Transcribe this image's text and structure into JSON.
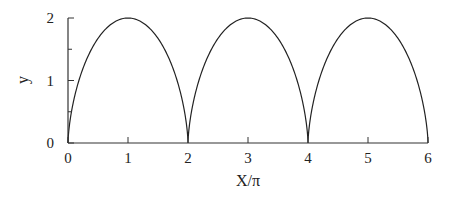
{
  "chart_data": {
    "type": "line",
    "title": "",
    "xlabel": "X/π",
    "ylabel": "y",
    "xlim": [
      0,
      6
    ],
    "ylim": [
      0,
      2
    ],
    "xticks": [
      0,
      1,
      2,
      3,
      4,
      5,
      6
    ],
    "xtick_labels": [
      "0",
      "1",
      "2",
      "3",
      "4",
      "5",
      "6"
    ],
    "yticks": [
      0,
      1,
      2
    ],
    "ytick_labels": [
      "0",
      "1",
      "2"
    ],
    "yminor_ticks": [
      0.5,
      1.5
    ],
    "grid": false,
    "legend": null,
    "series": [
      {
        "name": "cycloid",
        "description": "Cycloid y = 1 - cos(t), X = t - sin(t), plotted as X/π; arches of height 2 with cusps at X/π = 0, 2, 4, 6",
        "x": [
          0,
          0.5,
          1,
          1.5,
          2,
          2.5,
          3,
          3.5,
          4,
          4.5,
          5,
          5.5,
          6
        ],
        "y": [
          0,
          1.7,
          2,
          1.7,
          0,
          1.7,
          2,
          1.7,
          0,
          1.7,
          2,
          1.7,
          0
        ],
        "peaks": [
          {
            "x": 1,
            "y": 2
          },
          {
            "x": 3,
            "y": 2
          },
          {
            "x": 5,
            "y": 2
          }
        ],
        "cusps": [
          {
            "x": 0,
            "y": 0
          },
          {
            "x": 2,
            "y": 0
          },
          {
            "x": 4,
            "y": 0
          },
          {
            "x": 6,
            "y": 0
          }
        ],
        "color": "#222222"
      }
    ]
  },
  "style": {
    "line_color": "#222222",
    "axis_color": "#333333",
    "background": "#ffffff"
  }
}
